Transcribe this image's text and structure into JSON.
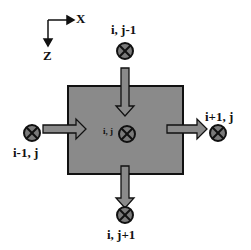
{
  "axes": {
    "x_label": "X",
    "z_label": "Z"
  },
  "nodes": {
    "center": "i, j",
    "top": "i, j-1",
    "bottom": "i, j+1",
    "left": "i-1, j",
    "right": "i+1, j"
  },
  "colors": {
    "cell_fill": "#8a8a8a",
    "arrow_fill": "#8a8a8a",
    "node_fill": "#7a7a7a",
    "stroke": "#111111"
  }
}
